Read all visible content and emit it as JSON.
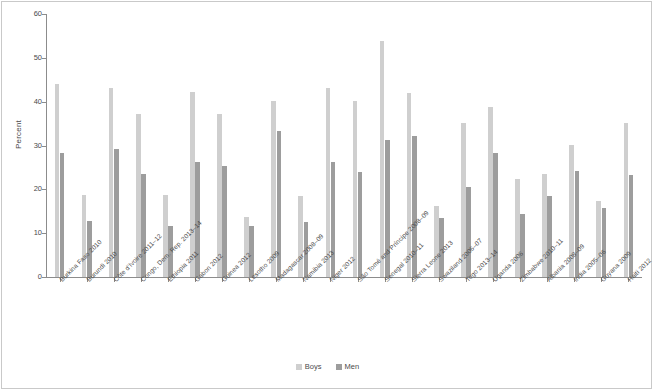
{
  "chart_data": {
    "type": "bar",
    "title": "",
    "subtitle": "",
    "xlabel": "",
    "ylabel": "Percent",
    "ylim": [
      0,
      60
    ],
    "yticks": [
      0,
      10,
      20,
      30,
      40,
      50,
      60
    ],
    "grid": false,
    "legend_position": "bottom-center",
    "categories": [
      "Burkina Faso 2010",
      "Burundi 2010",
      "Côte d'Ivoire 2011–12",
      "Congo, Dem. Rep. 2013–14",
      "Ethiopia 2011",
      "Gabon 2012",
      "Guinea 2012",
      "Lesotho 2009",
      "Madagascar 2008–09",
      "Namibia 2013",
      "Niger 2012",
      "São Tomé and Príncipe 2008–09",
      "Senegal 2010–11",
      "Sierra Leone 2013",
      "Swaziland 2006–07",
      "Togo 2013–14",
      "Uganda 2006",
      "Zimbabwe 2010–11",
      "Albania 2008–09",
      "India 2005–06",
      "Guyana 2009",
      "Haiti 2012"
    ],
    "series": [
      {
        "name": "Boys",
        "color": "#cfcfcf",
        "values": [
          44.0,
          18.7,
          43.2,
          37.2,
          18.6,
          42.2,
          37.1,
          13.6,
          40.2,
          18.5,
          43.1,
          40.2,
          53.8,
          42.0,
          16.3,
          35.2,
          38.9,
          22.3,
          23.4,
          30.2,
          17.3,
          35.1
        ]
      },
      {
        "name": "Men",
        "color": "#9d9d9d",
        "values": [
          28.4,
          12.7,
          29.3,
          23.5,
          11.7,
          26.3,
          25.4,
          11.7,
          33.2,
          12.6,
          26.2,
          24.0,
          31.3,
          32.1,
          13.4,
          20.5,
          28.3,
          14.4,
          18.5,
          24.2,
          15.7,
          23.3
        ]
      }
    ]
  },
  "legend": {
    "items": [
      {
        "label": "Boys",
        "color": "#cfcfcf"
      },
      {
        "label": "Men",
        "color": "#9d9d9d"
      }
    ]
  },
  "axes": {
    "y_label": "Percent"
  }
}
